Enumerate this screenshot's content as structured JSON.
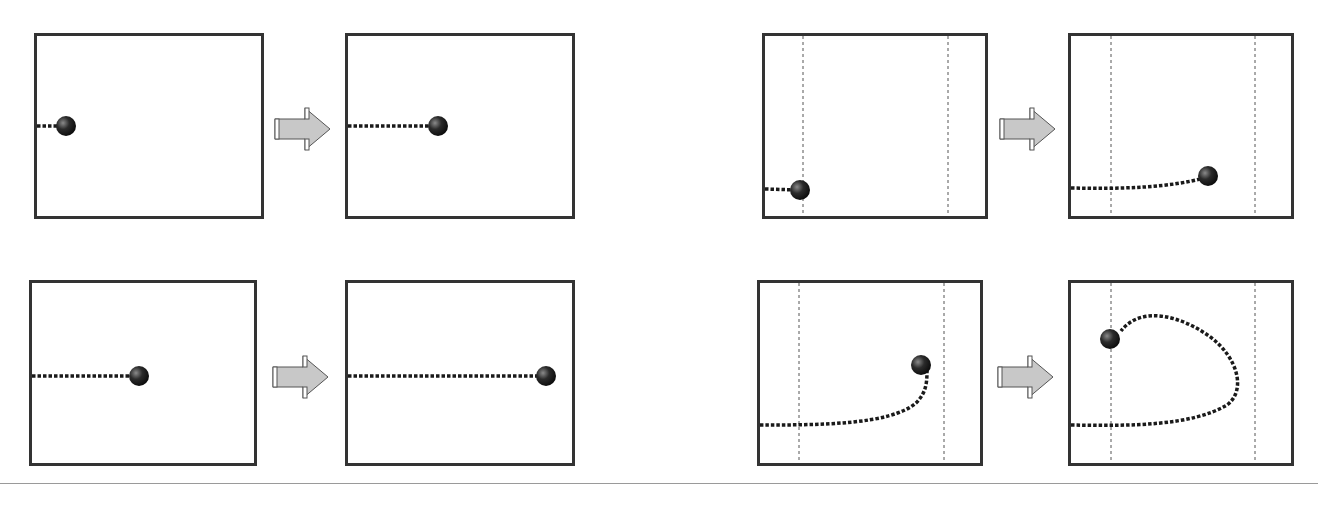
{
  "figure": {
    "colors": {
      "panel_border": "#333333",
      "trajectory": "#1a1a1a",
      "ball": "#2b2b2b",
      "arrow_fill": "#c8c8c8",
      "boundary_line": "#555555",
      "divider": "#9a9a9a"
    },
    "rows": [
      {
        "groups": [
          {
            "before": {
              "x": 34,
              "y": 33,
              "w": 230,
              "h": 186,
              "boundaries": [],
              "path": "M0,90 L28,90",
              "ball": [
                29,
                90
              ]
            },
            "arrow": {
              "x": 274,
              "y": 107
            },
            "after": {
              "x": 345,
              "y": 33,
              "w": 230,
              "h": 186,
              "boundaries": [],
              "path": "M0,90 L88,90",
              "ball": [
                90,
                90
              ]
            }
          },
          {
            "before": {
              "x": 762,
              "y": 33,
              "w": 226,
              "h": 186,
              "boundaries": [
                38,
                183
              ],
              "path": "M0,153 L34,154",
              "ball": [
                35,
                154
              ]
            },
            "arrow": {
              "x": 999,
              "y": 107
            },
            "after": {
              "x": 1068,
              "y": 33,
              "w": 226,
              "h": 186,
              "boundaries": [
                40,
                184
              ],
              "path": "M0,152 C50,153 100,152 136,141",
              "ball": [
                137,
                140
              ]
            }
          }
        ]
      },
      {
        "groups": [
          {
            "before": {
              "x": 29,
              "y": 280,
              "w": 228,
              "h": 186,
              "boundaries": [],
              "path": "M0,93 L106,93",
              "ball": [
                107,
                93
              ]
            },
            "arrow": {
              "x": 272,
              "y": 355
            },
            "after": {
              "x": 345,
              "y": 280,
              "w": 230,
              "h": 186,
              "boundaries": [],
              "path": "M0,93 L196,93",
              "ball": [
                198,
                93
              ]
            },
            "_unused": null
          },
          {
            "before": {
              "x": 757,
              "y": 280,
              "w": 226,
              "h": 186,
              "boundaries": [
                39,
                184
              ],
              "path": "M0,142 C60,142 130,142 156,120 C166,110 167,100 167,88",
              "ball": [
                161,
                82
              ]
            },
            "arrow": {
              "x": 997,
              "y": 355
            },
            "after": {
              "x": 1068,
              "y": 280,
              "w": 226,
              "h": 186,
              "boundaries": [
                40,
                184
              ],
              "path": "M0,142 C60,143 120,143 156,122 C175,108 168,75 138,53 C110,33 70,22 50,48",
              "ball": [
                39,
                56
              ]
            }
          }
        ]
      }
    ]
  }
}
